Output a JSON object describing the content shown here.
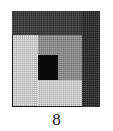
{
  "figure": {
    "caption": "8",
    "kind": "texture-mosaic-swatch",
    "canvas": {
      "width": 113,
      "height": 131,
      "background": "#ffffff"
    },
    "frame": {
      "name": "mosaic-square",
      "x": 12,
      "y": 11,
      "width": 88,
      "height": 96,
      "border_color": "#1d1d1d",
      "border_width": 1
    },
    "palette": {
      "near_black": "#0a0a0a",
      "dark_charcoal": "#3a3a3a",
      "dark_column": "#2e2e2e",
      "medium_gray": "#8c8c8c",
      "light_gray": "#c9c9c9",
      "white": "#ffffff"
    },
    "regions": [
      {
        "id": "top-band",
        "label": "Top dark band",
        "tone": "dark_charcoal",
        "color": "#3a3a3a",
        "x": 0,
        "y": 0,
        "width": 70,
        "height": 24
      },
      {
        "id": "right-column",
        "label": "Right dark column",
        "tone": "dark_column",
        "color": "#2e2e2e",
        "x": 70,
        "y": 0,
        "width": 18,
        "height": 96
      },
      {
        "id": "left-column",
        "label": "Left light column",
        "tone": "light_gray",
        "color": "#c9c9c9",
        "x": 1,
        "y": 24,
        "width": 25,
        "height": 71
      },
      {
        "id": "mid-upper",
        "label": "Middle upper medium block",
        "tone": "medium_gray",
        "color": "#8c8c8c",
        "x": 26,
        "y": 24,
        "width": 20,
        "height": 20
      },
      {
        "id": "mid-black",
        "label": "Middle black block",
        "tone": "near_black",
        "color": "#0a0a0a",
        "x": 26,
        "y": 44,
        "width": 20,
        "height": 25
      },
      {
        "id": "mid-lower",
        "label": "Middle lower light block",
        "tone": "light_gray",
        "color": "#c9c9c9",
        "x": 26,
        "y": 69,
        "width": 44,
        "height": 26
      },
      {
        "id": "right-inner-upper",
        "label": "Right inner medium block",
        "tone": "medium_gray",
        "color": "#8c8c8c",
        "x": 46,
        "y": 24,
        "width": 24,
        "height": 45
      }
    ],
    "tone_counts": {
      "near_black": 1,
      "dark_charcoal": 1,
      "dark_column": 1,
      "medium_gray": 2,
      "light_gray": 2
    }
  }
}
